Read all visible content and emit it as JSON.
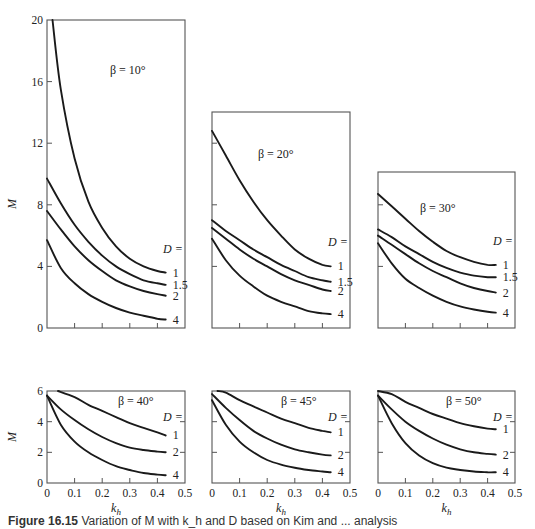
{
  "figure": {
    "caption_label": "Figure 16.15",
    "caption_text": "Variation of M with k_h and D based on Kim and ... analysis",
    "y_label": "M",
    "x_label": "k_h",
    "legend_title": "D ="
  },
  "chart_data": [
    {
      "type": "line",
      "title": "β = 10°",
      "xlabel": "",
      "ylabel": "M",
      "xlim": [
        0,
        0.5
      ],
      "ylim": [
        0,
        20
      ],
      "yticks": [
        0,
        4,
        8,
        12,
        16,
        20
      ],
      "xticks": [
        0,
        0.1,
        0.2,
        0.3,
        0.4,
        0.5
      ],
      "show_x_tick_labels": false,
      "legend_title": "D =",
      "series": [
        {
          "name": "1",
          "x": [
            0.02,
            0.05,
            0.1,
            0.15,
            0.2,
            0.25,
            0.3,
            0.35,
            0.4,
            0.43
          ],
          "values": [
            20.0,
            15.5,
            11.0,
            8.2,
            6.5,
            5.3,
            4.5,
            4.0,
            3.7,
            3.6
          ]
        },
        {
          "name": "1.5",
          "x": [
            0,
            0.05,
            0.1,
            0.15,
            0.2,
            0.25,
            0.3,
            0.35,
            0.4,
            0.43
          ],
          "values": [
            9.7,
            8.1,
            6.7,
            5.6,
            4.7,
            4.0,
            3.5,
            3.1,
            2.9,
            2.8
          ]
        },
        {
          "name": "2",
          "x": [
            0,
            0.05,
            0.1,
            0.15,
            0.2,
            0.25,
            0.3,
            0.35,
            0.4,
            0.43
          ],
          "values": [
            7.6,
            6.4,
            5.3,
            4.4,
            3.7,
            3.1,
            2.7,
            2.4,
            2.2,
            2.1
          ]
        },
        {
          "name": "4",
          "x": [
            0,
            0.05,
            0.1,
            0.15,
            0.2,
            0.25,
            0.3,
            0.35,
            0.4,
            0.43
          ],
          "values": [
            5.7,
            3.9,
            2.9,
            2.2,
            1.7,
            1.3,
            1.0,
            0.8,
            0.6,
            0.55
          ]
        }
      ]
    },
    {
      "type": "line",
      "title": "β = 20°",
      "xlabel": "",
      "ylabel": "",
      "xlim": [
        0,
        0.5
      ],
      "ylim": [
        0,
        14
      ],
      "yticks": [
        4,
        8,
        12
      ],
      "xticks": [
        0,
        0.1,
        0.2,
        0.3,
        0.4,
        0.5
      ],
      "show_x_tick_labels": false,
      "legend_title": "D =",
      "series": [
        {
          "name": "1",
          "x": [
            0,
            0.05,
            0.1,
            0.15,
            0.2,
            0.25,
            0.3,
            0.35,
            0.4,
            0.43
          ],
          "values": [
            12.8,
            11.2,
            9.6,
            8.2,
            7.0,
            6.0,
            5.1,
            4.5,
            4.1,
            4.0
          ]
        },
        {
          "name": "1.5",
          "x": [
            0,
            0.05,
            0.1,
            0.15,
            0.2,
            0.25,
            0.3,
            0.35,
            0.4,
            0.43
          ],
          "values": [
            7.0,
            6.3,
            5.7,
            5.1,
            4.6,
            4.1,
            3.7,
            3.3,
            3.1,
            3.0
          ]
        },
        {
          "name": "2",
          "x": [
            0,
            0.05,
            0.1,
            0.15,
            0.2,
            0.25,
            0.3,
            0.35,
            0.4,
            0.43
          ],
          "values": [
            6.5,
            5.8,
            5.1,
            4.5,
            4.0,
            3.5,
            3.1,
            2.8,
            2.5,
            2.4
          ]
        },
        {
          "name": "4",
          "x": [
            0,
            0.05,
            0.1,
            0.15,
            0.2,
            0.25,
            0.3,
            0.35,
            0.4,
            0.43
          ],
          "values": [
            5.8,
            4.4,
            3.4,
            2.7,
            2.1,
            1.7,
            1.4,
            1.1,
            0.95,
            0.9
          ]
        }
      ]
    },
    {
      "type": "line",
      "title": "β = 30°",
      "xlabel": "",
      "ylabel": "",
      "xlim": [
        0,
        0.5
      ],
      "ylim": [
        0,
        10
      ],
      "yticks": [
        4,
        8
      ],
      "xticks": [
        0,
        0.1,
        0.2,
        0.3,
        0.4,
        0.5
      ],
      "show_x_tick_labels": false,
      "legend_title": "D =",
      "series": [
        {
          "name": "1",
          "x": [
            0,
            0.05,
            0.1,
            0.15,
            0.2,
            0.25,
            0.3,
            0.35,
            0.4,
            0.43
          ],
          "values": [
            8.7,
            7.9,
            7.1,
            6.3,
            5.6,
            5.0,
            4.6,
            4.3,
            4.1,
            4.1
          ]
        },
        {
          "name": "1.5",
          "x": [
            0,
            0.05,
            0.1,
            0.15,
            0.2,
            0.25,
            0.3,
            0.35,
            0.4,
            0.43
          ],
          "values": [
            6.4,
            5.9,
            5.3,
            4.8,
            4.3,
            3.9,
            3.6,
            3.4,
            3.3,
            3.3
          ]
        },
        {
          "name": "2",
          "x": [
            0,
            0.05,
            0.1,
            0.15,
            0.2,
            0.25,
            0.3,
            0.35,
            0.4,
            0.43
          ],
          "values": [
            6.0,
            5.4,
            4.8,
            4.2,
            3.7,
            3.3,
            2.9,
            2.6,
            2.4,
            2.3
          ]
        },
        {
          "name": "4",
          "x": [
            0,
            0.05,
            0.1,
            0.15,
            0.2,
            0.25,
            0.3,
            0.35,
            0.4,
            0.43
          ],
          "values": [
            5.5,
            4.2,
            3.2,
            2.6,
            2.1,
            1.7,
            1.4,
            1.2,
            1.05,
            1.0
          ]
        }
      ]
    },
    {
      "type": "line",
      "title": "β = 40°",
      "xlabel": "k_h",
      "ylabel": "M",
      "xlim": [
        0,
        0.5
      ],
      "ylim": [
        0,
        6
      ],
      "yticks": [
        0,
        2,
        4,
        6
      ],
      "xticks": [
        0,
        0.1,
        0.2,
        0.3,
        0.4,
        0.5
      ],
      "show_x_tick_labels": true,
      "legend_title": "D =",
      "series": [
        {
          "name": "1",
          "x": [
            0.04,
            0.1,
            0.15,
            0.2,
            0.25,
            0.3,
            0.35,
            0.4,
            0.43
          ],
          "values": [
            6.2,
            5.6,
            5.1,
            4.7,
            4.3,
            3.9,
            3.6,
            3.3,
            3.1
          ]
        },
        {
          "name": "2",
          "x": [
            0,
            0.05,
            0.1,
            0.15,
            0.2,
            0.25,
            0.3,
            0.35,
            0.4,
            0.43
          ],
          "values": [
            5.7,
            4.8,
            4.1,
            3.5,
            3.0,
            2.6,
            2.3,
            2.15,
            2.05,
            2.0
          ]
        },
        {
          "name": "4",
          "x": [
            0,
            0.05,
            0.1,
            0.15,
            0.2,
            0.25,
            0.3,
            0.35,
            0.4,
            0.43
          ],
          "values": [
            5.7,
            3.8,
            2.7,
            2.0,
            1.5,
            1.1,
            0.85,
            0.65,
            0.55,
            0.5
          ]
        }
      ]
    },
    {
      "type": "line",
      "title": "β = 45°",
      "xlabel": "k_h",
      "ylabel": "",
      "xlim": [
        0,
        0.5
      ],
      "ylim": [
        0,
        6
      ],
      "yticks": [
        2,
        4
      ],
      "xticks": [
        0,
        0.1,
        0.2,
        0.3,
        0.4,
        0.5
      ],
      "show_x_tick_labels": true,
      "legend_title": "D =",
      "series": [
        {
          "name": "1",
          "x": [
            0.02,
            0.05,
            0.1,
            0.15,
            0.2,
            0.25,
            0.3,
            0.35,
            0.4,
            0.43
          ],
          "values": [
            6.2,
            5.9,
            5.4,
            5.0,
            4.6,
            4.2,
            3.9,
            3.6,
            3.4,
            3.3
          ]
        },
        {
          "name": "2",
          "x": [
            0,
            0.05,
            0.1,
            0.15,
            0.2,
            0.25,
            0.3,
            0.35,
            0.4,
            0.43
          ],
          "values": [
            5.8,
            4.9,
            4.1,
            3.4,
            2.9,
            2.5,
            2.2,
            2.0,
            1.85,
            1.8
          ]
        },
        {
          "name": "4",
          "x": [
            0,
            0.05,
            0.1,
            0.15,
            0.2,
            0.25,
            0.3,
            0.35,
            0.4,
            0.43
          ],
          "values": [
            5.4,
            3.8,
            2.7,
            2.0,
            1.5,
            1.2,
            1.0,
            0.85,
            0.75,
            0.7
          ]
        }
      ]
    },
    {
      "type": "line",
      "title": "β = 50°",
      "xlabel": "k_h",
      "ylabel": "",
      "xlim": [
        0,
        0.5
      ],
      "ylim": [
        0,
        6
      ],
      "yticks": [
        2,
        4
      ],
      "xticks": [
        0,
        0.1,
        0.2,
        0.3,
        0.4,
        0.5
      ],
      "show_x_tick_labels": true,
      "legend_title": "D =",
      "series": [
        {
          "name": "1",
          "x": [
            0,
            0.05,
            0.1,
            0.15,
            0.2,
            0.25,
            0.3,
            0.35,
            0.4,
            0.43
          ],
          "values": [
            6.3,
            5.8,
            5.3,
            4.9,
            4.5,
            4.2,
            3.9,
            3.7,
            3.55,
            3.5
          ]
        },
        {
          "name": "2",
          "x": [
            0,
            0.05,
            0.1,
            0.15,
            0.2,
            0.25,
            0.3,
            0.35,
            0.4,
            0.43
          ],
          "values": [
            5.7,
            4.8,
            4.0,
            3.4,
            2.9,
            2.5,
            2.2,
            2.0,
            1.9,
            1.85
          ]
        },
        {
          "name": "4",
          "x": [
            0,
            0.05,
            0.1,
            0.15,
            0.2,
            0.25,
            0.3,
            0.35,
            0.4,
            0.43
          ],
          "values": [
            5.7,
            3.9,
            2.6,
            1.8,
            1.3,
            1.0,
            0.85,
            0.75,
            0.7,
            0.7
          ]
        }
      ]
    }
  ]
}
